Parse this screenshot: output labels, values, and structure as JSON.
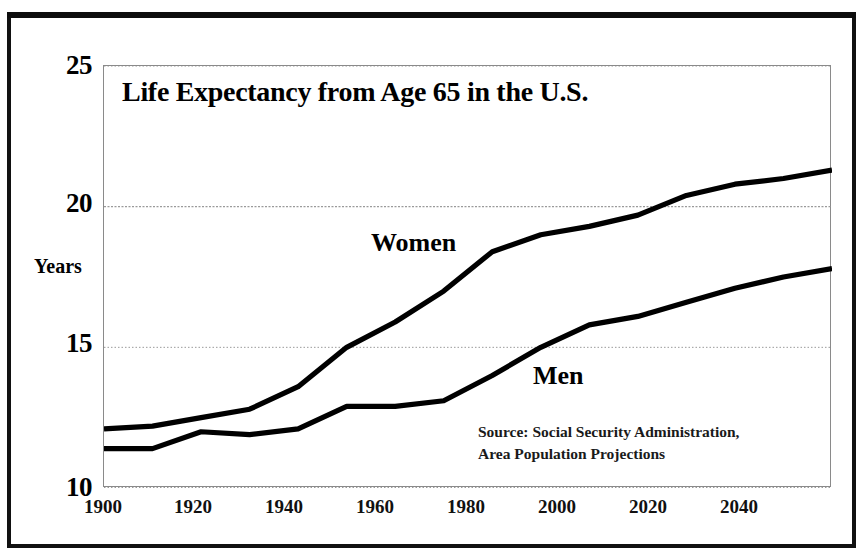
{
  "figure": {
    "title": "Life Expectancy from Age 65 in the U.S.",
    "y_axis_label": "Years",
    "source_line_1": "Source: Social Security Administration,",
    "source_line_2": "Area Population Projections",
    "series_label_women": "Women",
    "series_label_men": "Men",
    "colors": {
      "line": "#000000",
      "frame": "#111111",
      "plot_border": "#8a8a8a",
      "gridline": "#9a9a9a",
      "background": "#ffffff"
    }
  },
  "chart_data": {
    "type": "line",
    "title": "Life Expectancy from Age 65 in the U.S.",
    "xlabel": "",
    "ylabel": "Years",
    "xlim": [
      1900,
      2050
    ],
    "ylim": [
      10,
      25
    ],
    "yticks": [
      10,
      15,
      20,
      25
    ],
    "ytick_labels": [
      "10",
      "15",
      "20",
      "25"
    ],
    "xticks": [
      1900,
      1920,
      1940,
      1960,
      1980,
      2000,
      2020,
      2040
    ],
    "xtick_labels": [
      "1900",
      "1920",
      "1940",
      "1960",
      "1980",
      "2000",
      "2020",
      "2040"
    ],
    "x_minor_ticks": [
      1910,
      1930,
      1950,
      1970,
      1990,
      2010,
      2030,
      2050
    ],
    "grid": "horizontal-dotted",
    "legend": "inline-labels",
    "annotations": [
      "Source: Social Security Administration,",
      "Area Population Projections"
    ],
    "x": [
      1900,
      1910,
      1920,
      1930,
      1940,
      1950,
      1960,
      1970,
      1980,
      1990,
      2000,
      2010,
      2020,
      2030,
      2040,
      2050
    ],
    "series": [
      {
        "name": "Women",
        "values": [
          12.1,
          12.2,
          12.5,
          12.8,
          13.6,
          15.0,
          15.9,
          17.0,
          18.4,
          19.0,
          19.3,
          19.7,
          20.4,
          20.8,
          21.0,
          21.3
        ]
      },
      {
        "name": "Men",
        "values": [
          11.4,
          11.4,
          12.0,
          11.9,
          12.1,
          12.9,
          12.9,
          13.1,
          14.0,
          15.0,
          15.8,
          16.1,
          16.6,
          17.1,
          17.5,
          17.8
        ]
      }
    ]
  }
}
